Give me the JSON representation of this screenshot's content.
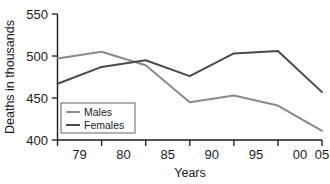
{
  "chart_data": {
    "type": "line",
    "title": "",
    "xlabel": "Years",
    "ylabel": "Deaths in thousands",
    "categories": [
      "79",
      "80",
      "85",
      "90",
      "95",
      "00",
      "05"
    ],
    "xlim": [
      0,
      6
    ],
    "ylim": [
      400,
      550
    ],
    "yticks": [
      400,
      450,
      500,
      550
    ],
    "grid": false,
    "legend_position": "inside-bottom-left",
    "series": [
      {
        "name": "Males",
        "color": "#8a8a8a",
        "values": [
          497,
          505,
          489,
          445,
          453,
          441,
          411
        ]
      },
      {
        "name": "Females",
        "color": "#4a4a4a",
        "values": [
          467,
          487,
          495,
          476,
          503,
          506,
          457
        ]
      }
    ]
  },
  "axes": {
    "y_tick_labels": [
      "550",
      "500",
      "450",
      "400"
    ],
    "x_tick_labels": [
      "79",
      "80",
      "85",
      "90",
      "95",
      "00",
      "05"
    ],
    "y_axis_title": "Deaths in thousands",
    "x_axis_title": "Years"
  },
  "legend": {
    "entries": [
      {
        "label": "Males",
        "color": "#8a8a8a"
      },
      {
        "label": "Females",
        "color": "#4a4a4a"
      }
    ]
  }
}
